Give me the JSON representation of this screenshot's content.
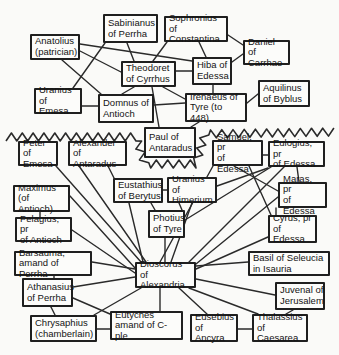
{
  "figure": {
    "type": "network-diagram",
    "canvas": {
      "width": 339,
      "height": 355,
      "background": "#fafaf8",
      "box_fill": "#fcfcfa",
      "box_border_color": "#1f1f1f",
      "line_color": "#2a2a2a",
      "text_color": "#141414"
    },
    "divider": {
      "style": "zigzag",
      "amplitude": 4,
      "step": 5.5,
      "stroke_width": 1.6,
      "spine": [
        [
          6,
          137
        ],
        [
          136,
          137
        ],
        [
          145,
          164
        ],
        [
          196,
          164
        ],
        [
          205,
          134
        ],
        [
          334,
          132
        ]
      ]
    },
    "nodes": [
      {
        "id": "anatolius",
        "label": "Anatolius\n(patrician)",
        "x": 30,
        "y": 34,
        "w": 50,
        "h": 26
      },
      {
        "id": "sabinianus",
        "label": "Sabinianus\nof Perrha",
        "x": 103,
        "y": 14,
        "w": 55,
        "h": 29
      },
      {
        "id": "sophronius",
        "label": "Sophronius of\nConstantina",
        "x": 164,
        "y": 16,
        "w": 64,
        "h": 26
      },
      {
        "id": "daniel",
        "label": "Daniel of\nCarrhae",
        "x": 243,
        "y": 40,
        "w": 47,
        "h": 25
      },
      {
        "id": "theodoret",
        "label": "Theodoret\nof Cyrrhus",
        "x": 121,
        "y": 61,
        "w": 55,
        "h": 26
      },
      {
        "id": "hiba",
        "label": "Hiba of\nEdessa",
        "x": 192,
        "y": 57,
        "w": 40,
        "h": 28
      },
      {
        "id": "uranius_emesa",
        "label": "Uranius of\nEmesa",
        "x": 34,
        "y": 88,
        "w": 48,
        "h": 26
      },
      {
        "id": "domnus",
        "label": "Domnus of\nAntioch",
        "x": 98,
        "y": 94,
        "w": 56,
        "h": 29
      },
      {
        "id": "irenaeus",
        "label": "Irenaeus of\nTyre (to 448)",
        "x": 185,
        "y": 93,
        "w": 62,
        "h": 29
      },
      {
        "id": "aquilinus",
        "label": "Aquilinus\nof Byblus",
        "x": 258,
        "y": 80,
        "w": 52,
        "h": 27
      },
      {
        "id": "paul",
        "label": "Paul of\nAntaradus",
        "x": 144,
        "y": 127,
        "w": 52,
        "h": 31
      },
      {
        "id": "peter",
        "label": "Peter of\nEmesa",
        "x": 18,
        "y": 141,
        "w": 40,
        "h": 25
      },
      {
        "id": "alexander",
        "label": "Alexander of\nAntaradus",
        "x": 68,
        "y": 141,
        "w": 59,
        "h": 25
      },
      {
        "id": "samuel",
        "label": "Samuel, pr\nof Edessa",
        "x": 212,
        "y": 140,
        "w": 51,
        "h": 26
      },
      {
        "id": "eulogius",
        "label": "Eulogius, pr\nof Edessa",
        "x": 268,
        "y": 141,
        "w": 57,
        "h": 26
      },
      {
        "id": "maximus",
        "label": "Maximus (of\nAntioch)",
        "x": 13,
        "y": 185,
        "w": 57,
        "h": 27
      },
      {
        "id": "eustathius",
        "label": "Eustathius\nof Berytus",
        "x": 113,
        "y": 178,
        "w": 50,
        "h": 25
      },
      {
        "id": "uranius_himerium",
        "label": "Uranius of\nHimerium",
        "x": 167,
        "y": 177,
        "w": 50,
        "h": 26
      },
      {
        "id": "maras",
        "label": "Maras, pr\nof Edessa",
        "x": 278,
        "y": 182,
        "w": 49,
        "h": 26
      },
      {
        "id": "pelagius",
        "label": "Pelagius, pr\nof Antioch",
        "x": 15,
        "y": 217,
        "w": 57,
        "h": 25
      },
      {
        "id": "photius",
        "label": "Photius\nof Tyre",
        "x": 148,
        "y": 210,
        "w": 37,
        "h": 28
      },
      {
        "id": "cyrus",
        "label": "Cyrus, pr\nof Edessa",
        "x": 268,
        "y": 215,
        "w": 49,
        "h": 28
      },
      {
        "id": "barsauma",
        "label": "Barsauma,\namand of Perrha",
        "x": 14,
        "y": 251,
        "w": 78,
        "h": 25
      },
      {
        "id": "dioscorus",
        "label": "Dioscorus of\nAlexandria",
        "x": 135,
        "y": 262,
        "w": 61,
        "h": 26
      },
      {
        "id": "basil",
        "label": "Basil of Seleucia\nin Isauria",
        "x": 248,
        "y": 251,
        "w": 82,
        "h": 25
      },
      {
        "id": "athanasius",
        "label": "Athanasius\nof Perrha",
        "x": 22,
        "y": 278,
        "w": 51,
        "h": 29
      },
      {
        "id": "juvenal",
        "label": "Juvenal of\nJerusalem",
        "x": 275,
        "y": 282,
        "w": 50,
        "h": 28
      },
      {
        "id": "chrysaphius",
        "label": "Chrysaphius\n(chamberlain)",
        "x": 30,
        "y": 315,
        "w": 67,
        "h": 27
      },
      {
        "id": "eutyches",
        "label": "Eutyches\namand of C-ple",
        "x": 110,
        "y": 311,
        "w": 73,
        "h": 29
      },
      {
        "id": "eusebius",
        "label": "Eusebius\nof Ancyra",
        "x": 190,
        "y": 314,
        "w": 48,
        "h": 28
      },
      {
        "id": "thalassius",
        "label": "Thalassius\nof Caesarea",
        "x": 252,
        "y": 314,
        "w": 56,
        "h": 28
      }
    ],
    "edges": [
      {
        "from": "anatolius",
        "to": "hiba",
        "line": [
          80,
          44,
          192,
          61
        ]
      },
      {
        "from": "anatolius",
        "to": "theodoret",
        "line": [
          80,
          51,
          121,
          72
        ]
      },
      {
        "from": "anatolius",
        "to": "domnus",
        "line": [
          62,
          60,
          101,
          94
        ]
      },
      {
        "from": "sabinianus",
        "to": "theodoret",
        "line": [
          127,
          43,
          134,
          61
        ]
      },
      {
        "from": "sabinianus",
        "to": "uranius_emesa",
        "line": [
          105,
          43,
          73,
          88
        ]
      },
      {
        "from": "sophronius",
        "to": "theodoret",
        "line": [
          167,
          42,
          153,
          61
        ]
      },
      {
        "from": "sophronius",
        "to": "hiba",
        "line": [
          199,
          42,
          206,
          57
        ]
      },
      {
        "from": "sophronius",
        "to": "daniel",
        "line": [
          228,
          35,
          243,
          45
        ]
      },
      {
        "from": "hiba",
        "to": "daniel",
        "line": [
          232,
          62,
          243,
          54
        ]
      },
      {
        "from": "theodoret",
        "to": "hiba",
        "line": [
          176,
          71,
          192,
          71
        ]
      },
      {
        "from": "hiba",
        "to": "irenaeus",
        "line": [
          213,
          85,
          213,
          93
        ]
      },
      {
        "from": "theodoret",
        "to": "domnus",
        "line": [
          134,
          87,
          122,
          94
        ]
      },
      {
        "from": "theodoret",
        "to": "irenaeus",
        "line": [
          163,
          87,
          185,
          99
        ]
      },
      {
        "from": "theodoret",
        "to": "paul",
        "line": [
          152,
          87,
          159,
          127
        ]
      },
      {
        "from": "uranius_emesa",
        "to": "domnus",
        "line": [
          82,
          106,
          98,
          106
        ]
      },
      {
        "from": "domnus",
        "to": "irenaeus",
        "line": [
          154,
          105,
          185,
          103
        ]
      },
      {
        "from": "irenaeus",
        "to": "aquilinus",
        "line": [
          247,
          103,
          258,
          94
        ]
      },
      {
        "from": "irenaeus",
        "to": "paul",
        "line": [
          199,
          122,
          191,
          127
        ]
      },
      {
        "from": "peter",
        "to": "dioscorus",
        "line": [
          56,
          166,
          141,
          262
        ]
      },
      {
        "from": "alexander",
        "to": "dioscorus",
        "line": [
          79,
          166,
          146,
          262
        ]
      },
      {
        "from": "alexander",
        "to": "eustathius",
        "line": [
          108,
          166,
          114,
          178
        ]
      },
      {
        "from": "maximus",
        "to": "dioscorus",
        "line": [
          70,
          196,
          135,
          268
        ]
      },
      {
        "from": "maximus",
        "to": "pelagius",
        "line": [
          40,
          212,
          40,
          217
        ]
      },
      {
        "from": "pelagius",
        "to": "dioscorus",
        "line": [
          72,
          230,
          135,
          273
        ]
      },
      {
        "from": "eustathius",
        "to": "uranius_himerium",
        "line": [
          163,
          190,
          167,
          190
        ]
      },
      {
        "from": "eustathius",
        "to": "photius",
        "line": [
          151,
          203,
          155,
          210
        ]
      },
      {
        "from": "eustathius",
        "to": "dioscorus",
        "line": [
          129,
          203,
          143,
          262
        ]
      },
      {
        "from": "uranius_himerium",
        "to": "photius",
        "line": [
          179,
          203,
          182,
          210
        ]
      },
      {
        "from": "uranius_himerium",
        "to": "dioscorus",
        "line": [
          192,
          203,
          171,
          262
        ]
      },
      {
        "from": "uranius_himerium",
        "to": "eulogius",
        "line": [
          217,
          186,
          268,
          168
        ]
      },
      {
        "from": "photius",
        "to": "dioscorus",
        "line": [
          165,
          238,
          165,
          262
        ]
      },
      {
        "from": "samuel",
        "to": "eulogius",
        "line": [
          263,
          155,
          268,
          155
        ]
      },
      {
        "from": "samuel",
        "to": "dioscorus",
        "line": [
          213,
          166,
          160,
          262
        ]
      },
      {
        "from": "samuel",
        "to": "maras",
        "line": [
          234,
          166,
          278,
          191
        ]
      },
      {
        "from": "samuel",
        "to": "cyrus",
        "line": [
          249,
          166,
          271,
          215
        ]
      },
      {
        "from": "eulogius",
        "to": "maras",
        "line": [
          297,
          167,
          299,
          182
        ]
      },
      {
        "from": "eulogius",
        "to": "photius",
        "line": [
          271,
          167,
          185,
          220
        ]
      },
      {
        "from": "eulogius",
        "to": "dioscorus",
        "line": [
          284,
          167,
          189,
          262
        ]
      },
      {
        "from": "maras",
        "to": "cyrus",
        "line": [
          276,
          208,
          276,
          215
        ]
      },
      {
        "from": "maras",
        "to": "dioscorus",
        "line": [
          278,
          197,
          196,
          264
        ]
      },
      {
        "from": "cyrus",
        "to": "dioscorus",
        "line": [
          268,
          237,
          196,
          269
        ]
      },
      {
        "from": "barsauma",
        "to": "dioscorus",
        "line": [
          92,
          262,
          135,
          269
        ]
      },
      {
        "from": "barsauma",
        "to": "athanasius",
        "line": [
          54,
          276,
          54,
          278
        ]
      },
      {
        "from": "athanasius",
        "to": "dioscorus",
        "line": [
          73,
          287,
          135,
          277
        ]
      },
      {
        "from": "athanasius",
        "to": "eutyches",
        "line": [
          73,
          298,
          110,
          314
        ]
      },
      {
        "from": "athanasius",
        "to": "chrysaphius",
        "line": [
          51,
          307,
          55,
          315
        ]
      },
      {
        "from": "chrysaphius",
        "to": "eutyches",
        "line": [
          97,
          329,
          110,
          329
        ]
      },
      {
        "from": "chrysaphius",
        "to": "dioscorus",
        "line": [
          94,
          315,
          141,
          288
        ]
      },
      {
        "from": "eutyches",
        "to": "dioscorus",
        "line": [
          160,
          311,
          160,
          288
        ]
      },
      {
        "from": "eusebius",
        "to": "dioscorus",
        "line": [
          207,
          314,
          179,
          288
        ]
      },
      {
        "from": "eusebius",
        "to": "thalassius",
        "line": [
          238,
          329,
          252,
          329
        ]
      },
      {
        "from": "thalassius",
        "to": "dioscorus",
        "line": [
          258,
          314,
          189,
          288
        ]
      },
      {
        "from": "thalassius",
        "to": "juvenal",
        "line": [
          286,
          314,
          293,
          310
        ]
      },
      {
        "from": "juvenal",
        "to": "dioscorus",
        "line": [
          275,
          295,
          196,
          279
        ]
      },
      {
        "from": "basil",
        "to": "dioscorus",
        "line": [
          248,
          262,
          196,
          266
        ]
      }
    ]
  }
}
